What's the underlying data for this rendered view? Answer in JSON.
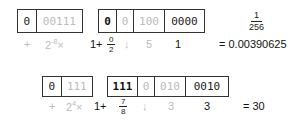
{
  "rows": [
    {
      "sign_box": {
        "sign": "0",
        "exponent": "00111"
      },
      "mantissa_box": {
        "lead": "0",
        "hidden": "0",
        "shifted": "100",
        "rest": "0000"
      },
      "labels": {
        "sign_op": "+",
        "power_base": "2",
        "power_exp": "-8",
        "power_times": "×",
        "one_plus": "1+",
        "frac_num": "0",
        "frac_den": "2",
        "arrow": "↓",
        "shift_amount": "5",
        "rest_value": "1"
      },
      "result_fraction": {
        "num": "1",
        "den": "256"
      },
      "result": "= 0.00390625"
    },
    {
      "sign_box": {
        "sign": "0",
        "exponent": "111"
      },
      "mantissa_box": {
        "lead": "111",
        "hidden": "0",
        "shifted": "010",
        "rest": "0010"
      },
      "labels": {
        "sign_op": "+",
        "power_base": "2",
        "power_exp": "4",
        "power_times": "×",
        "one_plus": "1+",
        "frac_num": "7",
        "frac_den": "8",
        "arrow": "↓",
        "shift_amount": "3",
        "rest_value": "3"
      },
      "result": "= 30"
    }
  ]
}
